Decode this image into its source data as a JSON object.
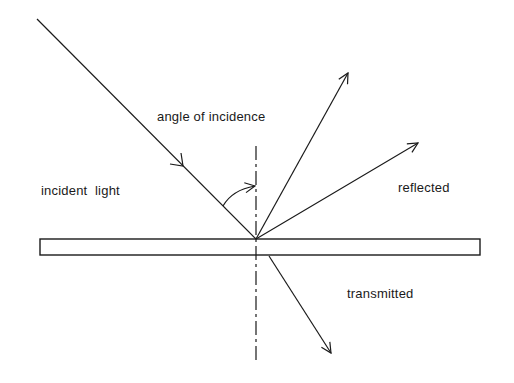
{
  "diagram": {
    "labels": {
      "angle": "angle of incidence",
      "incident": "incident  light",
      "reflected": "reflected",
      "transmitted": "transmitted"
    },
    "colors": {
      "line": "#1a1a1a",
      "background": "#ffffff"
    }
  }
}
